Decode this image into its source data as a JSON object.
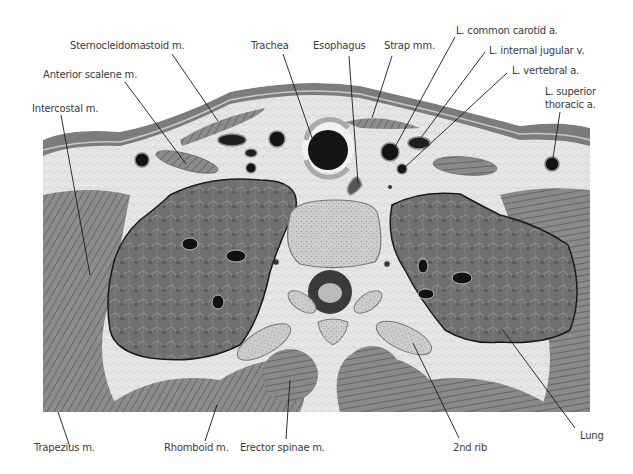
{
  "figure": {
    "colors": {
      "background": "#ffffff",
      "fat": "#e4e4e4",
      "muscle": "#8a8a8a",
      "muscle_dark": "#6a6a6a",
      "skin": "#7a7a7a",
      "lung": "#6e6e6e",
      "vessel": "#141414",
      "bone": "#c8c8c8",
      "leader_line": "#1a1a1a",
      "label_text": "#3a3a3a"
    }
  },
  "labels": {
    "top": [
      {
        "id": "sternocleidomastoid",
        "text": "Sternocleidomastoid m."
      },
      {
        "id": "anterior_scalene",
        "text": "Anterior scalene m."
      },
      {
        "id": "intercostal",
        "text": "Intercostal m."
      },
      {
        "id": "trachea",
        "text": "Trachea"
      },
      {
        "id": "esophagus",
        "text": "Esophagus"
      },
      {
        "id": "strap",
        "text": "Strap mm."
      },
      {
        "id": "l_common_carotid",
        "text": "L. common carotid a."
      },
      {
        "id": "l_internal_jugular",
        "text": "L. internal jugular v."
      },
      {
        "id": "l_vertebral",
        "text": "L. vertebral a."
      },
      {
        "id": "l_superior_thoracic_1",
        "text": "L. superior"
      },
      {
        "id": "l_superior_thoracic_2",
        "text": "thoracic a."
      }
    ],
    "bottom": [
      {
        "id": "trapezius",
        "text": "Trapezius m."
      },
      {
        "id": "rhomboid",
        "text": "Rhomboid m."
      },
      {
        "id": "erector_spinae",
        "text": "Erector spinae m."
      },
      {
        "id": "second_rib",
        "text": "2nd  rib"
      },
      {
        "id": "lung",
        "text": "Lung"
      }
    ]
  }
}
